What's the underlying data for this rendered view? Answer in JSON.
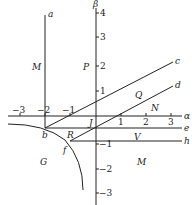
{
  "diagram": {
    "axes": {
      "horizontal": "α",
      "vertical": "β"
    },
    "x_ticks": [
      "-3",
      "-2",
      "-1",
      "1",
      "2",
      "3"
    ],
    "y_ticks": [
      "4",
      "3",
      "2",
      "1",
      "-1",
      "-2",
      "-3"
    ],
    "line_labels": [
      "a",
      "c",
      "d",
      "e",
      "h"
    ],
    "point_labels": [
      "b",
      "J",
      "R",
      "f"
    ],
    "region_labels": [
      "M",
      "P",
      "Q",
      "N",
      "V",
      "G",
      "M"
    ]
  }
}
